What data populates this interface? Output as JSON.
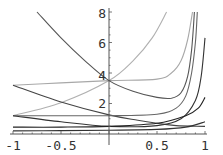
{
  "chart_data": {
    "type": "line",
    "title": "",
    "xlabel": "",
    "ylabel": "",
    "xlim": [
      -1,
      1
    ],
    "ylim": [
      0,
      8
    ],
    "grid": false,
    "legend": null,
    "x_ticks": [
      -1,
      -0.5,
      0.5,
      1
    ],
    "x_tick_labels": [
      "-1",
      "-0.5",
      "0.5",
      "1"
    ],
    "y_ticks": [
      2,
      4,
      6,
      8
    ],
    "y_tick_labels": [
      "2",
      "4",
      "6",
      "8"
    ],
    "series": [
      {
        "name": "curve-1",
        "color": "#b0b0b0",
        "points": [
          [
            -1,
            1.2
          ],
          [
            -0.5,
            2.05
          ],
          [
            0,
            3.5
          ],
          [
            0.25,
            4.8
          ],
          [
            0.45,
            6.3
          ],
          [
            0.6,
            8
          ]
        ]
      },
      {
        "name": "curve-2",
        "color": "#a8a8a8",
        "points": [
          [
            -1,
            3.2
          ],
          [
            -0.5,
            3.35
          ],
          [
            0,
            3.5
          ],
          [
            0.5,
            3.6
          ],
          [
            0.65,
            4.0
          ],
          [
            0.75,
            4.8
          ],
          [
            0.82,
            6.2
          ],
          [
            0.87,
            8
          ]
        ]
      },
      {
        "name": "curve-3",
        "color": "#555555",
        "points": [
          [
            -0.75,
            8
          ],
          [
            -0.5,
            6.3
          ],
          [
            -0.25,
            4.8
          ],
          [
            0,
            3.5
          ],
          [
            0.25,
            2.8
          ],
          [
            0.5,
            2.4
          ],
          [
            0.65,
            2.35
          ],
          [
            0.75,
            2.7
          ],
          [
            0.82,
            3.8
          ],
          [
            0.86,
            5.5
          ],
          [
            0.89,
            8
          ]
        ]
      },
      {
        "name": "curve-4",
        "color": "#444444",
        "points": [
          [
            -1,
            3.2
          ],
          [
            -0.5,
            2.1
          ],
          [
            0,
            1.25
          ],
          [
            0.3,
            0.9
          ],
          [
            0.5,
            0.7
          ],
          [
            0.7,
            0.55
          ],
          [
            1,
            0.5
          ]
        ]
      },
      {
        "name": "curve-5",
        "color": "#666666",
        "points": [
          [
            -1,
            1.2
          ],
          [
            0,
            1.2
          ],
          [
            0.5,
            1.3
          ],
          [
            0.7,
            1.7
          ],
          [
            0.8,
            2.5
          ],
          [
            0.86,
            4.0
          ],
          [
            0.9,
            6.0
          ],
          [
            0.92,
            8
          ]
        ]
      },
      {
        "name": "curve-6",
        "color": "#333333",
        "points": [
          [
            -1,
            1.2
          ],
          [
            -0.5,
            0.8
          ],
          [
            0,
            0.5
          ],
          [
            0.5,
            0.55
          ],
          [
            0.75,
            1.0
          ],
          [
            0.9,
            2.2
          ],
          [
            0.96,
            3.8
          ],
          [
            1,
            6.3
          ]
        ]
      },
      {
        "name": "curve-7",
        "color": "#222222",
        "points": [
          [
            -1,
            0.45
          ],
          [
            -0.5,
            0.45
          ],
          [
            0,
            0.5
          ],
          [
            0.5,
            0.7
          ],
          [
            0.8,
            1.2
          ],
          [
            0.93,
            1.7
          ],
          [
            1,
            2.4
          ]
        ]
      },
      {
        "name": "curve-8",
        "color": "#333333",
        "points": [
          [
            -1,
            0.2
          ],
          [
            -0.5,
            0.22
          ],
          [
            0,
            0.25
          ],
          [
            0.5,
            0.3
          ],
          [
            0.8,
            0.45
          ],
          [
            1,
            0.8
          ]
        ]
      }
    ]
  },
  "axes": {
    "x_labels": [
      "-1",
      "-0.5",
      "0.5",
      "1"
    ],
    "y_labels": [
      "2",
      "4",
      "6",
      "8"
    ]
  }
}
